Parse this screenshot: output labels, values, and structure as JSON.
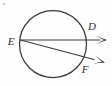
{
  "figure": {
    "background_color": "#fefefe",
    "stroke_color": "#3a3a3a",
    "label_color": "#2b2b2b",
    "width": 112,
    "height": 86
  },
  "circle": {
    "name": "circle",
    "cx": 53,
    "cy": 44,
    "r": 33.5
  },
  "points": {
    "E": {
      "label": "E",
      "x": 20.5,
      "y": 40.0,
      "label_x": 11,
      "label_y": 45
    },
    "D": {
      "label": "D",
      "x": 86.0,
      "y": 40.0,
      "label_x": 92,
      "label_y": 30
    },
    "F": {
      "label": "F",
      "x": 80.0,
      "y": 60.0,
      "label_x": 85,
      "label_y": 73
    }
  },
  "rays": [
    {
      "name": "ray-ED",
      "from": "E",
      "through": "D",
      "start_x": 20.5,
      "start_y": 40.0,
      "end_x": 100.0,
      "end_y": 40.0,
      "tip_x": 107.0,
      "tip_y": 40.0
    },
    {
      "name": "ray-EF",
      "from": "E",
      "through": "F",
      "start_x": 20.5,
      "start_y": 40.0,
      "end_x": 94.0,
      "end_y": 59.5,
      "tip_x": 105.0,
      "tip_y": 62.5
    }
  ],
  "artifact": {
    "name": "scan-speck",
    "x": 4,
    "y": 4,
    "r": 1.1
  }
}
